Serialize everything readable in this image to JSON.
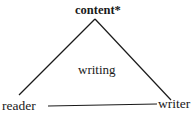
{
  "diagram": {
    "type": "triangle",
    "nodes": {
      "top": {
        "label": "content*"
      },
      "left": {
        "label": "reader"
      },
      "right": {
        "label": "writer"
      }
    },
    "center_label": "writing",
    "edges": [
      {
        "from": "content*",
        "to": "reader"
      },
      {
        "from": "content*",
        "to": "writer"
      },
      {
        "from": "reader",
        "to": "writer"
      }
    ],
    "colors": {
      "line": "#1a1a1a",
      "text": "#1a1a1a",
      "background": "#ffffff"
    }
  }
}
